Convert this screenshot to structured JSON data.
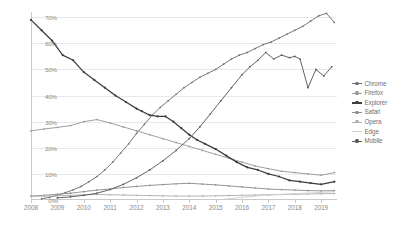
{
  "chart_data": {
    "type": "line",
    "title": "",
    "xlabel": "",
    "ylabel": "",
    "xlim": [
      2008,
      2019.6
    ],
    "ylim": [
      0,
      72
    ],
    "grid": true,
    "legend_position": "right",
    "y_ticks": [
      "0%",
      "10%",
      "20%",
      "30%",
      "40%",
      "50%",
      "60%",
      "70%"
    ],
    "y_tick_values": [
      0,
      10,
      20,
      30,
      40,
      50,
      60,
      70
    ],
    "x_ticks": [
      "2008",
      "2009",
      "2010",
      "2011",
      "2012",
      "2013",
      "2014",
      "2015",
      "2016",
      "2017",
      "2018",
      "2019"
    ],
    "x_tick_values": [
      2008,
      2009,
      2010,
      2011,
      2012,
      2013,
      2014,
      2015,
      2016,
      2017,
      2018,
      2019
    ],
    "series": [
      {
        "name": "Chrome",
        "color": "#707070",
        "marker": "dot",
        "x": [
          2008.4,
          2008.7,
          2009.0,
          2009.3,
          2009.6,
          2009.9,
          2010.2,
          2010.5,
          2010.8,
          2011.1,
          2011.4,
          2011.7,
          2012.0,
          2012.3,
          2012.6,
          2012.9,
          2013.2,
          2013.5,
          2013.8,
          2014.1,
          2014.4,
          2014.7,
          2015.0,
          2015.3,
          2015.6,
          2015.9,
          2016.2,
          2016.5,
          2016.8,
          2017.1,
          2017.4,
          2017.7,
          2018.0,
          2018.3,
          2018.6,
          2018.9,
          2019.2,
          2019.5
        ],
        "values": [
          0.5,
          1.0,
          1.8,
          2.8,
          3.9,
          5.2,
          7.0,
          9.0,
          11.5,
          14.5,
          18.0,
          21.5,
          25.5,
          29.0,
          32.5,
          35.5,
          38.0,
          40.5,
          43.0,
          45.0,
          47.0,
          48.5,
          50.0,
          52.0,
          54.0,
          55.5,
          56.5,
          58.0,
          59.5,
          60.5,
          62.0,
          63.5,
          65.0,
          66.5,
          68.5,
          70.5,
          71.5,
          68.0
        ]
      },
      {
        "name": "Firefox",
        "color": "#9a9a9a",
        "marker": "dot",
        "x": [
          2008.0,
          2008.5,
          2009.0,
          2009.5,
          2010.0,
          2010.5,
          2011.0,
          2011.5,
          2012.0,
          2012.5,
          2013.0,
          2013.5,
          2014.0,
          2014.5,
          2015.0,
          2015.5,
          2016.0,
          2016.5,
          2017.0,
          2017.5,
          2018.0,
          2018.5,
          2019.0,
          2019.5
        ],
        "values": [
          26.5,
          27.2,
          27.8,
          28.5,
          30.0,
          30.8,
          29.5,
          28.0,
          26.5,
          25.0,
          23.5,
          22.0,
          20.5,
          19.0,
          17.5,
          16.0,
          14.5,
          13.0,
          12.0,
          11.0,
          10.5,
          10.0,
          9.5,
          10.5
        ]
      },
      {
        "name": "Explorer",
        "color": "#3d3d3d",
        "marker": "dot",
        "x": [
          2008.0,
          2008.4,
          2008.8,
          2009.2,
          2009.6,
          2010.0,
          2010.4,
          2010.8,
          2011.2,
          2011.6,
          2012.0,
          2012.2,
          2012.5,
          2012.8,
          2013.1,
          2013.4,
          2013.7,
          2014.0,
          2014.3,
          2014.6,
          2015.0,
          2015.4,
          2015.8,
          2016.2,
          2016.6,
          2017.0,
          2017.4,
          2017.8,
          2018.2,
          2018.6,
          2019.0,
          2019.5
        ],
        "values": [
          69.0,
          65.0,
          61.0,
          55.5,
          53.5,
          49.0,
          46.0,
          43.0,
          40.0,
          37.5,
          35.0,
          34.0,
          32.5,
          32.0,
          32.0,
          30.0,
          27.5,
          25.0,
          23.0,
          21.5,
          19.5,
          17.0,
          14.5,
          12.5,
          11.5,
          10.0,
          9.0,
          7.5,
          7.0,
          6.5,
          6.0,
          7.0
        ]
      },
      {
        "name": "Safari",
        "color": "#8f8f8f",
        "marker": "dot",
        "x": [
          2008.0,
          2008.5,
          2009.0,
          2009.5,
          2010.0,
          2010.5,
          2011.0,
          2011.5,
          2012.0,
          2012.5,
          2013.0,
          2013.5,
          2014.0,
          2014.5,
          2015.0,
          2015.5,
          2016.0,
          2016.5,
          2017.0,
          2017.5,
          2018.0,
          2018.5,
          2019.0,
          2019.5
        ],
        "values": [
          1.5,
          1.8,
          2.2,
          2.6,
          3.2,
          3.8,
          4.2,
          4.8,
          5.2,
          5.6,
          5.9,
          6.2,
          6.4,
          6.1,
          5.8,
          5.4,
          5.0,
          4.6,
          4.2,
          4.0,
          3.8,
          3.6,
          3.5,
          3.6
        ]
      },
      {
        "name": "Opera",
        "color": "#b0b0b0",
        "marker": "dot",
        "x": [
          2008.0,
          2008.5,
          2009.0,
          2009.5,
          2010.0,
          2010.5,
          2011.0,
          2011.5,
          2012.0,
          2012.5,
          2013.0,
          2013.5,
          2014.0,
          2014.5,
          2015.0,
          2015.5,
          2016.0,
          2016.5,
          2017.0,
          2017.5,
          2018.0,
          2018.5,
          2019.0,
          2019.5
        ],
        "values": [
          1.4,
          1.5,
          1.6,
          1.8,
          2.0,
          2.1,
          2.0,
          1.9,
          1.8,
          1.7,
          1.6,
          1.5,
          1.5,
          1.5,
          1.6,
          1.7,
          1.8,
          1.9,
          2.0,
          2.1,
          2.2,
          2.3,
          2.4,
          2.5
        ]
      },
      {
        "name": "Edge",
        "color": "#cfcfcf",
        "marker": "none",
        "x": [
          2015.3,
          2015.8,
          2016.2,
          2016.6,
          2017.0,
          2017.4,
          2017.8,
          2018.2,
          2018.6,
          2019.0,
          2019.5
        ],
        "values": [
          0.3,
          0.8,
          1.2,
          1.6,
          1.9,
          2.1,
          2.3,
          2.5,
          2.7,
          2.9,
          3.2
        ]
      },
      {
        "name": "Mobile",
        "color": "#5a5a5a",
        "marker": "dot",
        "x": [
          2009.0,
          2009.5,
          2010.0,
          2010.5,
          2011.0,
          2011.5,
          2012.0,
          2012.5,
          2013.0,
          2013.5,
          2014.0,
          2014.4,
          2014.8,
          2015.2,
          2015.6,
          2016.0,
          2016.3,
          2016.6,
          2016.9,
          2017.2,
          2017.5,
          2017.8,
          2018.0,
          2018.2,
          2018.5,
          2018.8,
          2019.1,
          2019.4
        ],
        "values": [
          0.8,
          1.2,
          1.8,
          2.6,
          4.0,
          6.0,
          8.5,
          11.5,
          15.0,
          19.0,
          23.5,
          28.0,
          33.0,
          38.0,
          43.0,
          48.0,
          51.0,
          53.5,
          56.5,
          54.0,
          55.5,
          54.5,
          55.0,
          54.0,
          43.0,
          50.0,
          47.5,
          51.0
        ]
      }
    ]
  },
  "legend": {
    "items": [
      {
        "label": "Chrome"
      },
      {
        "label": "Firefox"
      },
      {
        "label": "Explorer"
      },
      {
        "label": "Safari"
      },
      {
        "label": "Opera"
      },
      {
        "label": "Edge"
      },
      {
        "label": "Mobile"
      }
    ]
  }
}
